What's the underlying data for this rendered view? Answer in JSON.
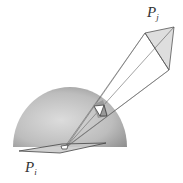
{
  "diagram": {
    "labels": {
      "pj": {
        "base": "P",
        "sub": "j"
      },
      "pi": {
        "base": "P",
        "sub": "i"
      }
    },
    "colors": {
      "background": "#ffffff",
      "hemisphere_light": "#d8d8d8",
      "hemisphere_dark": "#8e8e8e",
      "patch_fill": "#dcdcdc",
      "projection_fill": "#ffffff",
      "line": "#555555",
      "label": "#333333"
    },
    "elements": [
      "receiving patch Pi (base plane)",
      "unit hemisphere centered on Pi",
      "emitting patch Pj",
      "projection rays from Pj corners to Pi center",
      "projection of Pj on hemisphere surface",
      "projection onto base plane"
    ]
  }
}
